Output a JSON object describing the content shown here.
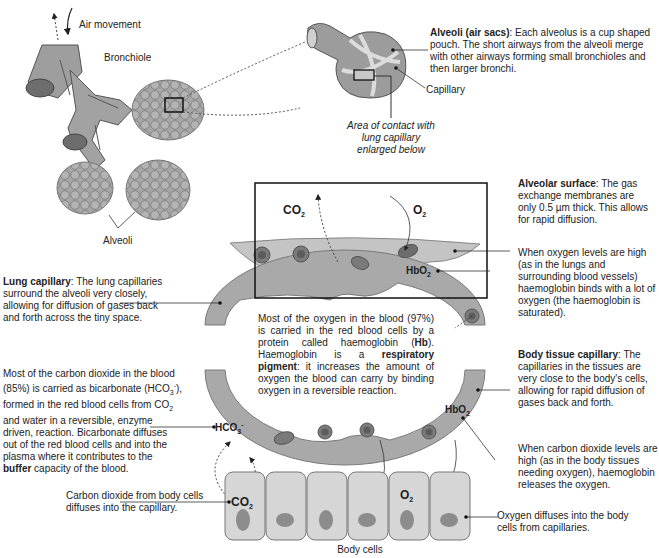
{
  "labels": {
    "air_movement": "Air movement",
    "bronchiole": "Bronchiole",
    "alveoli": "Alveoli",
    "capillary": "Capillary",
    "area_contact": "Area of contact with lung capillary enlarged below",
    "body_cells": "Body cells"
  },
  "alveoli_sacs": {
    "title": "Alveoli (air sacs)",
    "text": ": Each alveolus is a cup shaped pouch. The short airways from the alveoli merge with other airways forming small bronchioles and then larger bronchi."
  },
  "alveolar_surface": {
    "title": "Alveolar surface",
    "text": ": The gas exchange membranes are only 0.5 µm thick. This allows for rapid diffusion."
  },
  "oxygen_high": {
    "text": "When oxygen levels are high (as in the lungs and surrounding blood vessels) haemoglobin binds with a lot of oxygen  (the haemoglobin is saturated)."
  },
  "lung_capillary": {
    "title": "Lung capillary",
    "text": ": The lung capillaries surround the alveoli very closely, allowing for diffusion of gases back and forth across the tiny space."
  },
  "oxygen_blood": {
    "part1": "Most of the oxygen in the blood (97%) is carried in the red blood cells by a protein called haemoglobin (",
    "hb": "Hb",
    "part2": "). Haemoglobin is a ",
    "pigment": "respiratory pigment",
    "part3": ": it increases the amount of oxygen the blood can carry by binding oxygen in a reversible reaction."
  },
  "body_tissue_capillary": {
    "title": "Body tissue capillary",
    "text": ": The capillaries in the tissues are very close to the body's cells, allowing for rapid diffusion of gases back and forth."
  },
  "co2_blood": {
    "part1": "Most of the carbon dioxide in the blood (85%) is carried as bicarbonate (HCO",
    "part2": "), formed in the red blood cells from CO",
    "part3": " and water in a reversible, enzyme driven, reaction. Bicarbonate diffuses out of the red blood cells and into the plasma where it contributes to the ",
    "buffer": "buffer",
    "part4": " capacity of the blood."
  },
  "co2_high": {
    "text": "When carbon dioxide levels are high (as in the body tissues needing oxygen), haemoglobin releases the oxygen."
  },
  "co2_body": {
    "text": "Carbon dioxide from body cells diffuses into the capillary."
  },
  "o2_body": {
    "text": "Oxygen diffuses into the body cells from capillaries."
  },
  "gases": {
    "co2": "CO",
    "o2": "O",
    "sub2": "2",
    "sub3": "3",
    "hbo": "HbO",
    "hco": "HCO",
    "minus": "-"
  },
  "colors": {
    "tissue": "#a9a9a9",
    "tissue_dark": "#7d7d7d",
    "cell_fill": "#d8d8d8",
    "nucleus": "#8c8c8c",
    "rbc": "#8a8a8a",
    "line": "#333333"
  }
}
